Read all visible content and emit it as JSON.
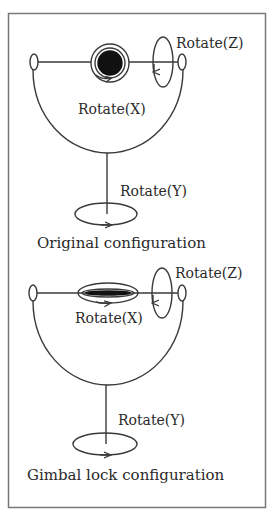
{
  "figure": {
    "type": "gimbal diagram",
    "colors": {
      "stroke": "#3a3a3a",
      "fill_dark": "#111111",
      "border": "#777777",
      "background": "#ffffff"
    },
    "panels": [
      {
        "name": "original",
        "caption": "Original configuration",
        "labels": {
          "rotate_z": "Rotate(Z)",
          "rotate_x": "Rotate(X)",
          "rotate_y": "Rotate(Y)"
        }
      },
      {
        "name": "gimbal-lock",
        "caption": "Gimbal lock configuration",
        "labels": {
          "rotate_z": "Rotate(Z)",
          "rotate_x": "Rotate(X)",
          "rotate_y": "Rotate(Y)"
        }
      }
    ]
  }
}
